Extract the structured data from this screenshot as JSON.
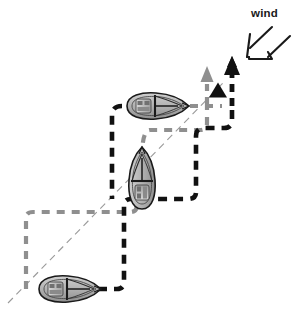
{
  "diagram": {
    "title": "wind",
    "type": "sailing-tactics-diagram",
    "labels": {
      "wind_label": "wind"
    },
    "colors": {
      "black_track": "#111111",
      "gray_track": "#8f8f8f",
      "thin_reference_line": "#9a9a9a",
      "hull_outline": "#1a1a1a",
      "hull_fill": "#b9b9b9",
      "mark_triangle": "#111111",
      "background": "#ffffff",
      "text": "#1a1a1a"
    },
    "elements": {
      "wind_arrow": {
        "name": "wind-arrow",
        "style": "open-outline-arrow",
        "direction": "down-left",
        "points_to": "course"
      },
      "mark": {
        "name": "course-mark",
        "shape": "filled-triangle",
        "x": 218,
        "y": 90
      },
      "black_heading_arrow": {
        "name": "black-heading-arrow",
        "direction": "up",
        "x": 232,
        "y_from": 104,
        "y_to": 62
      },
      "gray_heading_arrow": {
        "name": "gray-heading-arrow",
        "direction": "up",
        "x": 207,
        "y_from": 104,
        "y_to": 70
      }
    },
    "boats": [
      {
        "name": "boat-top",
        "heading": "east",
        "x": 158,
        "y": 106,
        "length": 62,
        "beam": 26,
        "rotation": 0
      },
      {
        "name": "boat-middle",
        "heading": "north",
        "x": 142,
        "y": 178,
        "length": 62,
        "beam": 26,
        "rotation": -90
      },
      {
        "name": "boat-bottom",
        "heading": "east",
        "x": 70,
        "y": 289,
        "length": 62,
        "beam": 26,
        "rotation": 0
      }
    ],
    "tracks": [
      {
        "name": "black-track",
        "color": "#111111",
        "width": 4.6,
        "dash": "9 7",
        "description": "thick black dashed tacking path from bottom boat up to mark",
        "path": "M 98 289 L 117 289 Q 124 289 124 281 L 124 206 Q 124 199 131 199 L 188 199 Q 196 199 196 192 L 196 136 Q 196 128 204 128 L 224 128 Q 232 128 232 120 L 232 106"
      },
      {
        "name": "black-track-upper",
        "color": "#111111",
        "width": 4.6,
        "dash": "9 7",
        "description": "thick black dashed path along top boat course",
        "path": "M 122 106 Q 112 106 112 116 L 112 199"
      },
      {
        "name": "gray-track",
        "color": "#8f8f8f",
        "width": 4.2,
        "dash": "8 7",
        "description": "gray dashed path of the second boat",
        "path": "M 26 289 L 26 218 Q 26 212 33 212 L 130 212 Q 137 212 137 205 L 137 196"
      },
      {
        "name": "gray-track-mid",
        "color": "#8f8f8f",
        "width": 4.2,
        "dash": "8 7",
        "description": "gray dashed path from middle boat to right then up",
        "path": "M 142 158 Q 142 130 150 130 L 200 130 Q 207 130 207 123 L 207 104"
      },
      {
        "name": "gray-track-top",
        "color": "#8f8f8f",
        "width": 4.2,
        "dash": "8 7",
        "description": "gray dashed path along top boat heading to right",
        "path": "M 190 106 L 222 106"
      },
      {
        "name": "reference-line",
        "color": "#9a9a9a",
        "width": 1.1,
        "dash": "7 5",
        "description": "thin diagonal wind/ladder reference line",
        "path": "M 8 303 L 224 82"
      }
    ]
  }
}
